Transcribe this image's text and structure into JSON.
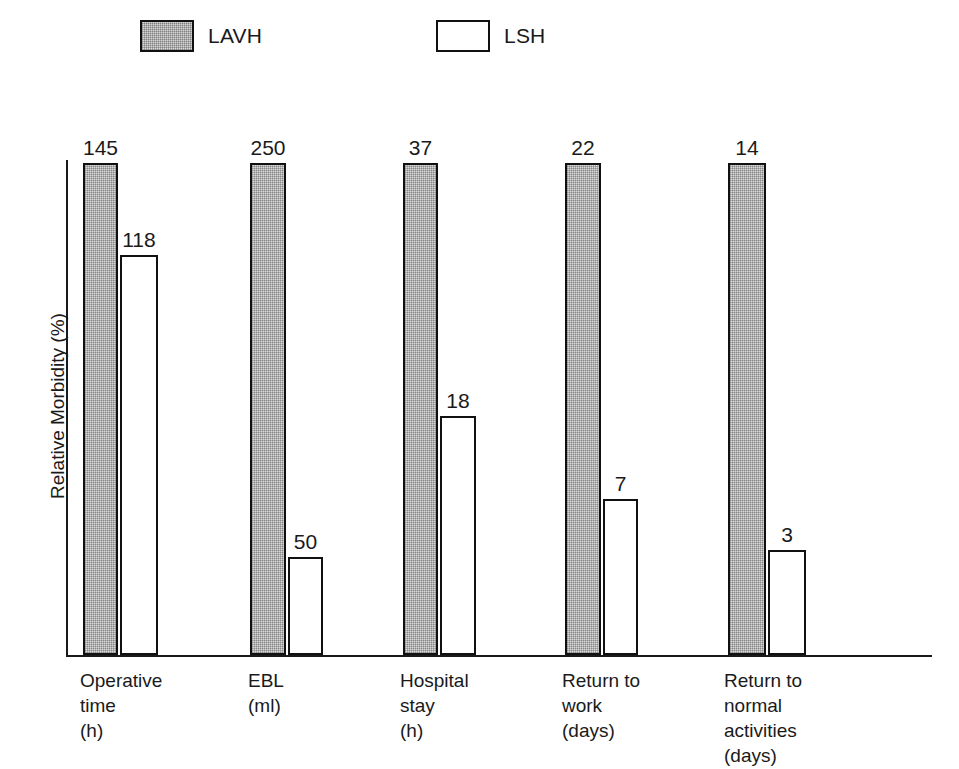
{
  "chart_data": {
    "type": "bar",
    "title": "",
    "xlabel": "",
    "ylabel": "Relative Morbidity (%)",
    "ylim": [
      0,
      100
    ],
    "grid": false,
    "legend_position": "top",
    "categories": [
      "Operative\ntime\n(h)",
      "EBL\n(ml)",
      "Hospital\nstay\n(h)",
      "Return to\nwork\n(days)",
      "Return to\nnormal\nactivities\n(days)"
    ],
    "series": [
      {
        "name": "LAVH",
        "fill": "hatch",
        "values": [
          145,
          250,
          37,
          22,
          14
        ],
        "relative_percent": [
          100,
          100,
          100,
          100,
          100
        ]
      },
      {
        "name": "LSH",
        "fill": "white",
        "values": [
          118,
          50,
          18,
          7,
          3
        ],
        "relative_percent": [
          81.4,
          20.0,
          48.6,
          31.8,
          21.4
        ]
      }
    ],
    "note": "Each LAVH bar is normalized to 100% relative morbidity; LSH bars are drawn in proportion to the paired LAVH value."
  },
  "legend": {
    "items": [
      {
        "label": "LAVH",
        "fill": "hatch"
      },
      {
        "label": "LSH",
        "fill": "white"
      }
    ]
  },
  "axes": {
    "y_title": "Relative Morbidity (%)"
  },
  "colors": {
    "ink": "#1a1a1a",
    "bar_stroke": "#111111",
    "hatch_fill": "#d9d9d9",
    "plain_fill": "#ffffff",
    "background": "#ffffff"
  }
}
